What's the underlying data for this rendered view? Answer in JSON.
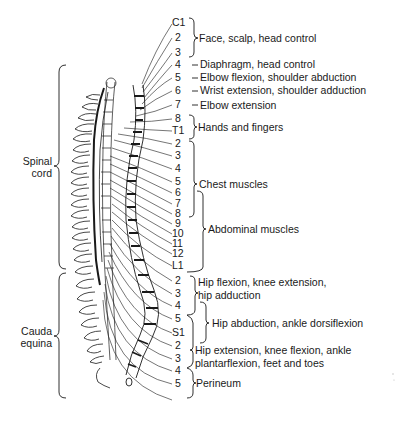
{
  "figure": {
    "type": "spinal cord segment innervation diagram",
    "colors": {
      "ink": "#1a1a1a",
      "background": "#ffffff"
    }
  },
  "side_labels": [
    {
      "line1": "Spinal",
      "line2": "cord"
    },
    {
      "line1": "Cauda",
      "line2": "equina"
    }
  ],
  "segments": [
    {
      "label": "C1",
      "y": 22
    },
    {
      "label": "2",
      "y": 37
    },
    {
      "label": "3",
      "y": 52
    },
    {
      "label": "4",
      "y": 64
    },
    {
      "label": "5",
      "y": 77
    },
    {
      "label": "6",
      "y": 90
    },
    {
      "label": "7",
      "y": 104
    },
    {
      "label": "8",
      "y": 118
    },
    {
      "label": "T1",
      "y": 130
    },
    {
      "label": "2",
      "y": 143
    },
    {
      "label": "3",
      "y": 155
    },
    {
      "label": "4",
      "y": 168
    },
    {
      "label": "5",
      "y": 181
    },
    {
      "label": "6",
      "y": 192
    },
    {
      "label": "7",
      "y": 203
    },
    {
      "label": "8",
      "y": 213
    },
    {
      "label": "9",
      "y": 223
    },
    {
      "label": "10",
      "y": 233
    },
    {
      "label": "11",
      "y": 243
    },
    {
      "label": "12",
      "y": 253
    },
    {
      "label": "L1",
      "y": 265
    },
    {
      "label": "2",
      "y": 280
    },
    {
      "label": "3",
      "y": 293
    },
    {
      "label": "4",
      "y": 305
    },
    {
      "label": "5",
      "y": 318
    },
    {
      "label": "S1",
      "y": 332
    },
    {
      "label": "2",
      "y": 345
    },
    {
      "label": "3",
      "y": 358
    },
    {
      "label": "4",
      "y": 370
    },
    {
      "label": "5",
      "y": 383
    }
  ],
  "functions": [
    {
      "text": "Face, scalp, head control",
      "segments": "C1-3"
    },
    {
      "text": "Diaphragm, head control",
      "segments": "C4"
    },
    {
      "text": "Elbow flexion, shoulder abduction",
      "segments": "C5"
    },
    {
      "text": "Wrist extension, shoulder adduction",
      "segments": "C6"
    },
    {
      "text": "Elbow extension",
      "segments": "C7"
    },
    {
      "text": "Hands and fingers",
      "segments": "C8-T1"
    },
    {
      "text": "Chest muscles",
      "segments": "T2-T8"
    },
    {
      "text": "Abdominal muscles",
      "segments": "T6-L1"
    },
    {
      "text": "Hip flexion, knee extension,",
      "text2": "hip adduction",
      "segments": "L2-L4"
    },
    {
      "text": "Hip abduction, ankle dorsiflexion",
      "segments": "L4-S1"
    },
    {
      "text": "Hip extension, knee flexion, ankle",
      "text2": "plantarflexion, feet and toes",
      "segments": "L5-S3"
    },
    {
      "text": "Perineum",
      "segments": "S3-S5"
    }
  ]
}
